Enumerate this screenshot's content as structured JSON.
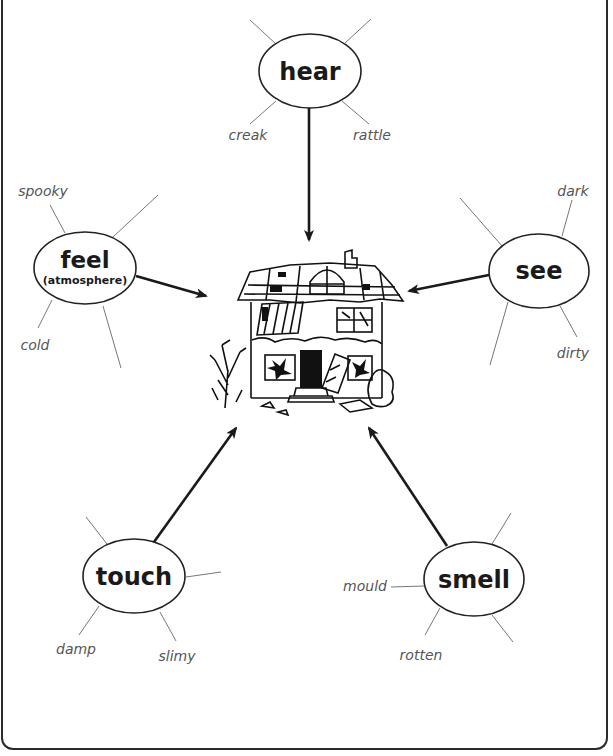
{
  "diagram": {
    "center": {
      "label": "haunted-house"
    },
    "nodes": {
      "hear": {
        "title": "hear",
        "leaves": [
          "creak",
          "rattle"
        ]
      },
      "feel": {
        "title": "feel",
        "subtitle": "(atmosphere)",
        "leaves": [
          "spooky",
          "cold"
        ]
      },
      "see": {
        "title": "see",
        "leaves": [
          "dark",
          "dirty"
        ]
      },
      "touch": {
        "title": "touch",
        "leaves": [
          "damp",
          "slimy"
        ]
      },
      "smell": {
        "title": "smell",
        "leaves": [
          "mould",
          "rotten"
        ]
      }
    }
  }
}
